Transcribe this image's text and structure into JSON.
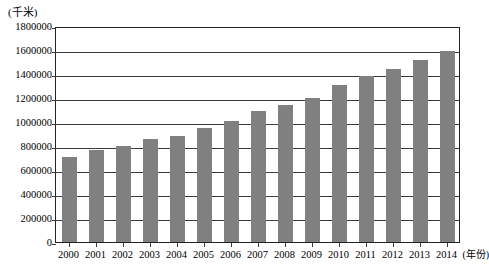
{
  "chart_data": {
    "type": "bar",
    "title": "",
    "subtitle": "",
    "xlabel": "(年份)",
    "ylabel": "(千米)",
    "unit_label": "(千米)",
    "categories": [
      "2000",
      "2001",
      "2002",
      "2003",
      "2004",
      "2005",
      "2006",
      "2007",
      "2008",
      "2009",
      "2010",
      "2011",
      "2012",
      "2013",
      "2014"
    ],
    "values": [
      710000,
      765000,
      800000,
      855000,
      880000,
      950000,
      1010000,
      1090000,
      1145000,
      1200000,
      1305000,
      1385000,
      1440000,
      1515000,
      1595000
    ],
    "ylim": [
      0,
      1800000
    ],
    "ytick_step": 200000,
    "ytick_labels": [
      "1800000",
      "1600000",
      "1400000",
      "1200000",
      "1000000",
      "800000",
      "600000",
      "400000",
      "200000",
      "0"
    ],
    "ytick_values": [
      1800000,
      1600000,
      1400000,
      1200000,
      1000000,
      800000,
      600000,
      400000,
      200000,
      0
    ],
    "grid": true,
    "legend": false,
    "legend_position": "none",
    "bar_color": "#808080",
    "axis_color": "#3a3a3a",
    "background_color": "#ffffff",
    "series": [
      {
        "name": "",
        "values": [
          710000,
          765000,
          800000,
          855000,
          880000,
          950000,
          1010000,
          1090000,
          1145000,
          1200000,
          1305000,
          1385000,
          1440000,
          1515000,
          1595000
        ]
      }
    ]
  }
}
